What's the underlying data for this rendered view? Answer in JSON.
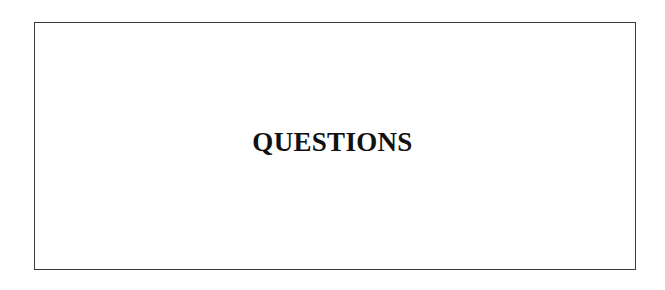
{
  "page": {
    "heading": "QUESTIONS"
  },
  "colors": {
    "border": "#3a3a3a",
    "text": "#111111",
    "background": "#ffffff"
  }
}
